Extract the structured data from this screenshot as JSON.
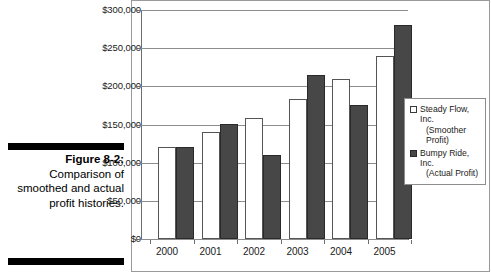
{
  "figure": {
    "label": "Figure 8-2:",
    "caption": "Comparison of smoothed and actual profit histories."
  },
  "legend": {
    "items": [
      {
        "name": "Steady Flow, Inc.",
        "sub": "(Smoother Profit)",
        "swatch": "light",
        "color": "#ffffff"
      },
      {
        "name": "Bumpy Ride, Inc.",
        "sub": "(Actual Profit)",
        "swatch": "dark",
        "color": "#474747"
      }
    ]
  },
  "chart_data": {
    "type": "bar",
    "title": "",
    "xlabel": "",
    "ylabel": "",
    "categories": [
      "2000",
      "2001",
      "2002",
      "2003",
      "2004",
      "2005"
    ],
    "series": [
      {
        "name": "Steady Flow, Inc. (Smoother Profit)",
        "color": "#ffffff",
        "values": [
          120000,
          140000,
          158000,
          184000,
          209000,
          240000
        ]
      },
      {
        "name": "Bumpy Ride, Inc. (Actual Profit)",
        "color": "#474747",
        "values": [
          120000,
          151000,
          110000,
          215000,
          175000,
          281000
        ]
      }
    ],
    "ylim": [
      0,
      300000
    ],
    "ytick_values": [
      0,
      50000,
      100000,
      150000,
      200000,
      250000,
      300000
    ],
    "ytick_labels": [
      "$0",
      "$50,000",
      "$100,000",
      "$150,000",
      "$200,000",
      "$250,000",
      "$300,000"
    ],
    "grid": true,
    "legend_position": "right-inside"
  }
}
